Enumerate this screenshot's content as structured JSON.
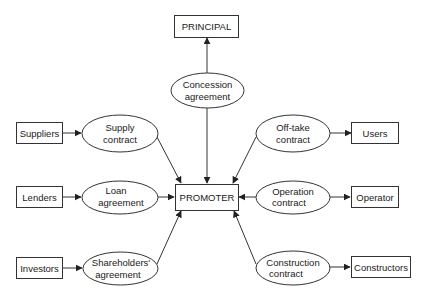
{
  "diagram": {
    "type": "contract-structure",
    "center": {
      "id": "promoter",
      "label": "PROMOTER"
    },
    "parties": [
      {
        "id": "principal",
        "label": "PRINCIPAL"
      },
      {
        "id": "suppliers",
        "label": "Suppliers"
      },
      {
        "id": "lenders",
        "label": "Lenders"
      },
      {
        "id": "investors",
        "label": "Investors"
      },
      {
        "id": "users",
        "label": "Users"
      },
      {
        "id": "operator",
        "label": "Operator"
      },
      {
        "id": "constructors",
        "label": "Constructors"
      }
    ],
    "contracts": [
      {
        "id": "concession",
        "line1": "Concession",
        "line2": "agreement"
      },
      {
        "id": "supply",
        "line1": "Supply",
        "line2": "contract"
      },
      {
        "id": "loan",
        "line1": "Loan",
        "line2": "agreement"
      },
      {
        "id": "shareholders",
        "line1": "Shareholders'",
        "line2": "agreement"
      },
      {
        "id": "offtake",
        "line1": "Off-take",
        "line2": "contract"
      },
      {
        "id": "operation",
        "line1": "Operation",
        "line2": "contract"
      },
      {
        "id": "construction",
        "line1": "Construction",
        "line2": "contract"
      }
    ],
    "edges": [
      {
        "from": "concession",
        "to": "principal"
      },
      {
        "from": "concession",
        "to": "promoter"
      },
      {
        "from": "suppliers",
        "to": "supply"
      },
      {
        "from": "supply",
        "to": "promoter"
      },
      {
        "from": "lenders",
        "to": "loan"
      },
      {
        "from": "loan",
        "to": "promoter"
      },
      {
        "from": "investors",
        "to": "shareholders"
      },
      {
        "from": "shareholders",
        "to": "promoter"
      },
      {
        "from": "offtake",
        "to": "users"
      },
      {
        "from": "offtake",
        "to": "promoter"
      },
      {
        "from": "operation",
        "to": "operator"
      },
      {
        "from": "operation",
        "to": "promoter"
      },
      {
        "from": "construction",
        "to": "constructors"
      },
      {
        "from": "construction",
        "to": "promoter"
      }
    ]
  }
}
